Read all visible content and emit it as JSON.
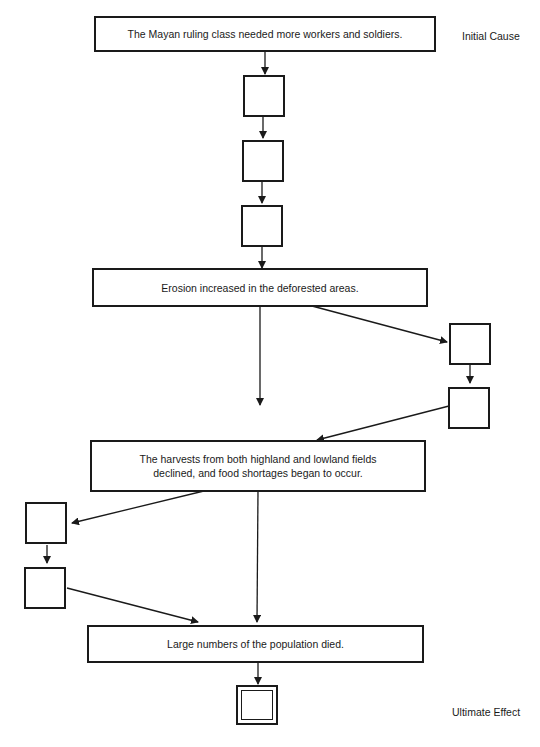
{
  "labels": {
    "initial_cause": "Initial Cause",
    "ultimate_effect": "Ultimate Effect"
  },
  "boxes": {
    "cause": "The Mayan ruling class needed more workers and soldiers.",
    "erosion": "Erosion increased in the deforested areas.",
    "harvests_line1": "The harvests from both highland and lowland fields",
    "harvests_line2": "declined, and food shortages began to occur.",
    "population": "Large numbers of the population died."
  },
  "empty_boxes": [
    "chain-1",
    "chain-2",
    "chain-3",
    "right-1",
    "right-2",
    "left-1",
    "left-2",
    "ultimate-effect"
  ]
}
